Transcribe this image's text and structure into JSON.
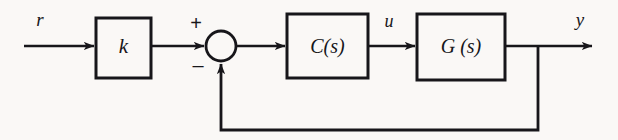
{
  "diagram": {
    "type": "block-diagram",
    "canvas": {
      "width": 618,
      "height": 140
    },
    "colors": {
      "background": "#faf8f6",
      "stroke": "#17161a",
      "block_fill": "#faf8f6",
      "text": "#17161a"
    },
    "blocks": [
      {
        "id": "gain",
        "label": "k",
        "x": 96,
        "y": 18,
        "width": 55,
        "height": 60
      },
      {
        "id": "controller",
        "label": "C(s)",
        "x": 287,
        "y": 14,
        "width": 81,
        "height": 64
      },
      {
        "id": "plant",
        "label": "G (s)",
        "x": 417,
        "y": 14,
        "width": 88,
        "height": 66
      }
    ],
    "summing_junction": {
      "id": "sum",
      "cx": 221,
      "cy": 46,
      "r": 15,
      "plus_sign": "+",
      "minus_sign": "–",
      "plus_pos": {
        "x": 196,
        "y": 30
      },
      "minus_pos": {
        "x": 198,
        "y": 70
      }
    },
    "signals": [
      {
        "id": "reference",
        "label": "r",
        "x": 40,
        "y": 26
      },
      {
        "id": "control",
        "label": "u",
        "x": 389,
        "y": 27
      },
      {
        "id": "output",
        "label": "y",
        "x": 580,
        "y": 26
      }
    ],
    "connections": [
      {
        "id": "r-to-gain",
        "from": "input",
        "to": "gain",
        "arrow": true
      },
      {
        "id": "gain-to-sum",
        "from": "gain",
        "to": "sum",
        "arrow": true
      },
      {
        "id": "sum-to-controller",
        "from": "sum",
        "to": "controller",
        "arrow": true
      },
      {
        "id": "controller-to-plant",
        "from": "controller",
        "to": "plant",
        "arrow": true
      },
      {
        "id": "plant-to-output",
        "from": "plant",
        "to": "output",
        "arrow": true
      },
      {
        "id": "feedback-path",
        "from": "plant-output-tap",
        "to": "sum",
        "arrow": true,
        "sign": "negative"
      }
    ]
  }
}
